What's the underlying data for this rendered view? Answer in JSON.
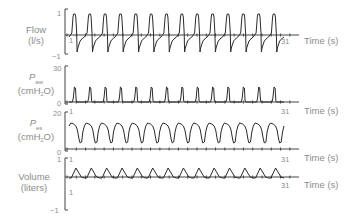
{
  "chart_data": {
    "type": "line",
    "title": "",
    "xlabel": "Time (s)",
    "x_ticks": [
      "1",
      "31"
    ],
    "xlim": [
      1,
      31
    ],
    "panels": [
      {
        "id": "flow",
        "ylabel": "Flow (l/s)",
        "ylabel_line1": "Flow",
        "ylabel_line2": "(l/s)",
        "ylim": [
          -1,
          1
        ],
        "y_ticks": [
          "1",
          "-1"
        ],
        "baseline": 0,
        "breaths": 14,
        "peak_inspiratory": 0.75,
        "peak_expiratory": -0.6,
        "show_time_label": true
      },
      {
        "id": "paw",
        "ylabel": "Paw (cmH2O)",
        "ylabel_sym": "P",
        "ylabel_sub": "aw",
        "ylabel_unit_a": "(cmH",
        "ylabel_unit_sub": "2",
        "ylabel_unit_b": "O)",
        "ylim": [
          0,
          30
        ],
        "y_ticks": [
          "30",
          "0"
        ],
        "baseline": 0,
        "breaths": 14,
        "peak": 10,
        "show_time_label": true
      },
      {
        "id": "pes",
        "ylabel": "Pes (cmH2O)",
        "ylabel_sym": "P",
        "ylabel_sub": "es",
        "ylabel_unit_a": "(cmH",
        "ylabel_unit_sub": "2",
        "ylabel_unit_b": "O)",
        "ylim": [
          0,
          20
        ],
        "y_ticks": [
          "20",
          "0"
        ],
        "baseline": 0,
        "breaths": 14,
        "plateau": 12,
        "trough": 2,
        "show_time_label": true
      },
      {
        "id": "volume",
        "ylabel": "Volume (liters)",
        "ylabel_line1": "Volume",
        "ylabel_line2": "(liters)",
        "ylim": [
          -1,
          1
        ],
        "y_ticks": [
          "1",
          "-1"
        ],
        "baseline": 0,
        "breaths": 14,
        "peak": 0.3,
        "show_time_label": true
      }
    ]
  },
  "labels": {
    "time_axis": "Time (s)",
    "start": "1",
    "end": "31",
    "flow_l1": "Flow",
    "flow_l2": "(l/s)",
    "flow_top": "1",
    "flow_bot": "−1",
    "paw_sym": "P",
    "paw_sub": "aw",
    "unit_a": "(cmH",
    "unit_sub": "2",
    "unit_b": "O)",
    "paw_top": "30",
    "paw_bot": "0",
    "pes_sym": "P",
    "pes_sub": "es",
    "pes_top": "20",
    "pes_bot": "0",
    "vol_l1": "Volume",
    "vol_l2": "(liters)",
    "vol_top": "1",
    "vol_bot": "−1"
  },
  "colors": {
    "trace": "#2b2b2b",
    "axis": "#444444",
    "text": "#8c8c8c"
  }
}
